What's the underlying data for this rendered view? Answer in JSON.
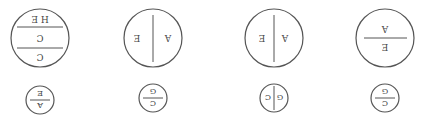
{
  "diagram": {
    "orientation": "rotated 180 degrees",
    "large_circles": [
      {
        "id": "lc1",
        "labels": [
          "H E",
          "C",
          "C"
        ],
        "divider": "two horizontal lines"
      },
      {
        "id": "lc2",
        "labels": [
          "A",
          "E"
        ],
        "divider": "vertical line"
      },
      {
        "id": "lc3",
        "labels": [
          "A",
          "E"
        ],
        "divider": "vertical line"
      },
      {
        "id": "lc4",
        "labels": [
          "A",
          "E"
        ],
        "divider": "horizontal line"
      }
    ],
    "small_circles": [
      {
        "id": "sc1",
        "labels": [
          "E",
          "A"
        ],
        "divider": "horizontal line"
      },
      {
        "id": "sc2",
        "labels": [
          "G",
          "C"
        ],
        "divider": "horizontal line"
      },
      {
        "id": "sc3",
        "labels": [
          "G",
          "C"
        ],
        "divider": "vertical line"
      },
      {
        "id": "sc4",
        "labels": [
          "G",
          "C"
        ],
        "divider": "horizontal line"
      }
    ]
  }
}
